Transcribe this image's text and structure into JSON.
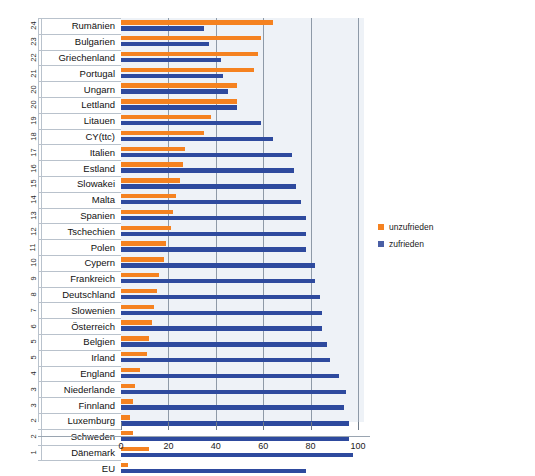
{
  "chart_data": {
    "type": "bar",
    "orientation": "horizontal",
    "title": "",
    "xlabel": "",
    "ylabel": "",
    "xlim": [
      0,
      105
    ],
    "xticks": [
      0,
      20,
      40,
      60,
      80,
      100
    ],
    "grid": true,
    "legend_position": "right",
    "legend": [
      {
        "name": "unzufrieden",
        "color": "#f58220"
      },
      {
        "name": "zufrieden",
        "color": "#4a5fa5"
      }
    ],
    "series": [
      {
        "name": "unzufrieden",
        "color": "#f58220"
      },
      {
        "name": "zufrieden",
        "color": "#2e4a9e"
      }
    ],
    "categories": [
      "Rumänien",
      "Bulgarien",
      "Griechenland",
      "Portugal",
      "Ungarn",
      "Lettland",
      "Litauen",
      "CY(ttc)",
      "Italien",
      "Estland",
      "Slowakei",
      "Malta",
      "Spanien",
      "Tschechien",
      "Polen",
      "Cypern",
      "Frankreich",
      "Deutschland",
      "Slowenien",
      "Österreich",
      "Belgien",
      "Irland",
      "England",
      "Niederlande",
      "Finnland",
      "Luxemburg",
      "Schweden",
      "Dänemark",
      "EU"
    ],
    "ranks": [
      "24",
      "23",
      "22",
      "21",
      "20",
      "20",
      "19",
      "18",
      "17",
      "16",
      "15",
      "14",
      "13",
      "12",
      "11",
      "10",
      "9",
      "8",
      "7",
      "6",
      "5",
      "5",
      "4",
      "3",
      "3",
      "2",
      "2",
      "1",
      ""
    ],
    "rows": [
      {
        "rank": "24",
        "label": "Rumänien",
        "unzufrieden": 64,
        "zufrieden": 35
      },
      {
        "rank": "23",
        "label": "Bulgarien",
        "unzufrieden": 59,
        "zufrieden": 37
      },
      {
        "rank": "22",
        "label": "Griechenland",
        "unzufrieden": 58,
        "zufrieden": 42
      },
      {
        "rank": "21",
        "label": "Portugal",
        "unzufrieden": 56,
        "zufrieden": 43
      },
      {
        "rank": "20",
        "label": "Ungarn",
        "unzufrieden": 49,
        "zufrieden": 45
      },
      {
        "rank": "20",
        "label": "Lettland",
        "unzufrieden": 49,
        "zufrieden": 49
      },
      {
        "rank": "19",
        "label": "Litauen",
        "unzufrieden": 38,
        "zufrieden": 59
      },
      {
        "rank": "18",
        "label": "CY(ttc)",
        "unzufrieden": 35,
        "zufrieden": 64
      },
      {
        "rank": "17",
        "label": "Italien",
        "unzufrieden": 27,
        "zufrieden": 72
      },
      {
        "rank": "16",
        "label": "Estland",
        "unzufrieden": 26,
        "zufrieden": 73
      },
      {
        "rank": "15",
        "label": "Slowakei",
        "unzufrieden": 25,
        "zufrieden": 74
      },
      {
        "rank": "14",
        "label": "Malta",
        "unzufrieden": 23,
        "zufrieden": 76
      },
      {
        "rank": "13",
        "label": "Spanien",
        "unzufrieden": 22,
        "zufrieden": 78
      },
      {
        "rank": "12",
        "label": "Tschechien",
        "unzufrieden": 21,
        "zufrieden": 78
      },
      {
        "rank": "11",
        "label": "Polen",
        "unzufrieden": 19,
        "zufrieden": 78
      },
      {
        "rank": "10",
        "label": "Cypern",
        "unzufrieden": 18,
        "zufrieden": 82
      },
      {
        "rank": "9",
        "label": "Frankreich",
        "unzufrieden": 16,
        "zufrieden": 82
      },
      {
        "rank": "8",
        "label": "Deutschland",
        "unzufrieden": 15,
        "zufrieden": 84
      },
      {
        "rank": "7",
        "label": "Slowenien",
        "unzufrieden": 14,
        "zufrieden": 85
      },
      {
        "rank": "6",
        "label": "Österreich",
        "unzufrieden": 13,
        "zufrieden": 85
      },
      {
        "rank": "5",
        "label": "Belgien",
        "unzufrieden": 12,
        "zufrieden": 87
      },
      {
        "rank": "5",
        "label": "Irland",
        "unzufrieden": 11,
        "zufrieden": 88
      },
      {
        "rank": "4",
        "label": "England",
        "unzufrieden": 8,
        "zufrieden": 92
      },
      {
        "rank": "3",
        "label": "Niederlande",
        "unzufrieden": 6,
        "zufrieden": 95
      },
      {
        "rank": "3",
        "label": "Finnland",
        "unzufrieden": 5,
        "zufrieden": 94
      },
      {
        "rank": "2",
        "label": "Luxemburg",
        "unzufrieden": 4,
        "zufrieden": 96
      },
      {
        "rank": "2",
        "label": "Schweden",
        "unzufrieden": 5,
        "zufrieden": 96
      },
      {
        "rank": "1",
        "label": "Dänemark",
        "unzufrieden": 12,
        "zufrieden": 98
      },
      {
        "rank": "",
        "label": "EU",
        "unzufrieden": 3,
        "zufrieden": 78
      }
    ]
  }
}
